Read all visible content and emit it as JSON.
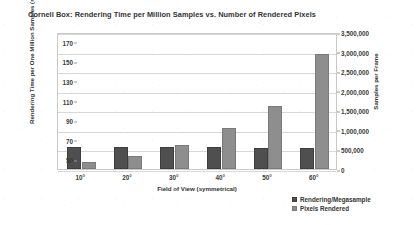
{
  "chart_data": {
    "type": "bar",
    "title": "Cornell Box: Rendering Time per Million Samples vs. Number of Rendered Pixels",
    "xlabel": "Field of View (symmetrical)",
    "ylabel": "Rendering Time per One Million Samples (ms)",
    "ylabel_secondary": "Samples per Frame",
    "categories": [
      "10°",
      "20°",
      "30°",
      "40°",
      "50°",
      "60°"
    ],
    "series": [
      {
        "name": "Rendering/Megasample",
        "axis": "left",
        "color": "#4f4f4f",
        "values": [
          63,
          63,
          63,
          63,
          62,
          62
        ]
      },
      {
        "name": "Pixels Rendered",
        "axis": "right",
        "color": "#8e8e8e",
        "values": [
          180000,
          340000,
          620000,
          1050000,
          1620000,
          2950000
        ]
      }
    ],
    "ylim": [
      40,
      180
    ],
    "yticks": [
      50,
      70,
      90,
      110,
      130,
      150,
      170
    ],
    "ytick_labels": [
      "50",
      "70",
      "90",
      "110",
      "130",
      "150",
      "170"
    ],
    "ylim_secondary": [
      0,
      3500000
    ],
    "yticks_secondary": [
      0,
      500000,
      1000000,
      1500000,
      2000000,
      2500000,
      3000000,
      3500000
    ],
    "ytick_labels_secondary": [
      "0",
      "500,000",
      "1,000,000",
      "1,500,000",
      "2,000,000",
      "2,500,000",
      "3,000,000",
      "3,500,000"
    ],
    "grid": true,
    "legend_position": "bottom-right",
    "legend": [
      "Rendering/Megasample",
      "Pixels Rendered"
    ]
  }
}
